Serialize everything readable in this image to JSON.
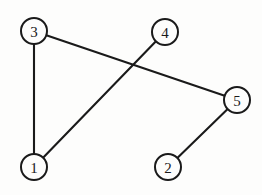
{
  "figure": {
    "width": 262,
    "height": 195,
    "background_color": "#fdfdfc",
    "stroke_color": "#1a1a1a",
    "node_fill_color": "#fdfdfc",
    "node_radius": 13,
    "edge_width": 2.1
  },
  "graph": {
    "type": "node-link-diagram",
    "directed": false,
    "node_count": 5,
    "edge_count": 4,
    "nodes": [
      {
        "id": "3",
        "label": "3",
        "x": 34,
        "y": 31
      },
      {
        "id": "4",
        "label": "4",
        "x": 165,
        "y": 32
      },
      {
        "id": "5",
        "label": "5",
        "x": 237,
        "y": 100
      },
      {
        "id": "1",
        "label": "1",
        "x": 34,
        "y": 167
      },
      {
        "id": "2",
        "label": "2",
        "x": 168,
        "y": 167
      }
    ],
    "edges": [
      {
        "source": "3",
        "target": "1",
        "name": "edge-3-1"
      },
      {
        "source": "3",
        "target": "5",
        "name": "edge-3-5"
      },
      {
        "source": "4",
        "target": "1",
        "name": "edge-4-1"
      },
      {
        "source": "2",
        "target": "5",
        "name": "edge-2-5"
      }
    ],
    "crossings": [
      {
        "between": [
          "edge-3-5",
          "edge-4-1"
        ],
        "x": 131,
        "y": 66
      }
    ]
  }
}
